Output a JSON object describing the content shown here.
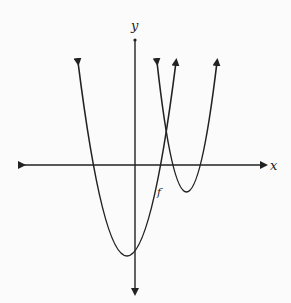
{
  "diagram": {
    "axis_labels": {
      "x": "x",
      "y": "y"
    },
    "curve_label": "f",
    "curves": [
      {
        "name": "large-parabola",
        "description": "upward-opening parabola, vertex below origin slightly left of y-axis, crosses x-axis on both sides of y-axis"
      },
      {
        "name": "small-parabola",
        "description": "narrower upward-opening parabola, vertex below x-axis to the right, shares an x-intercept with large parabola"
      }
    ],
    "colors": {
      "stroke": "#222222",
      "background": "#fbfbfb"
    }
  }
}
